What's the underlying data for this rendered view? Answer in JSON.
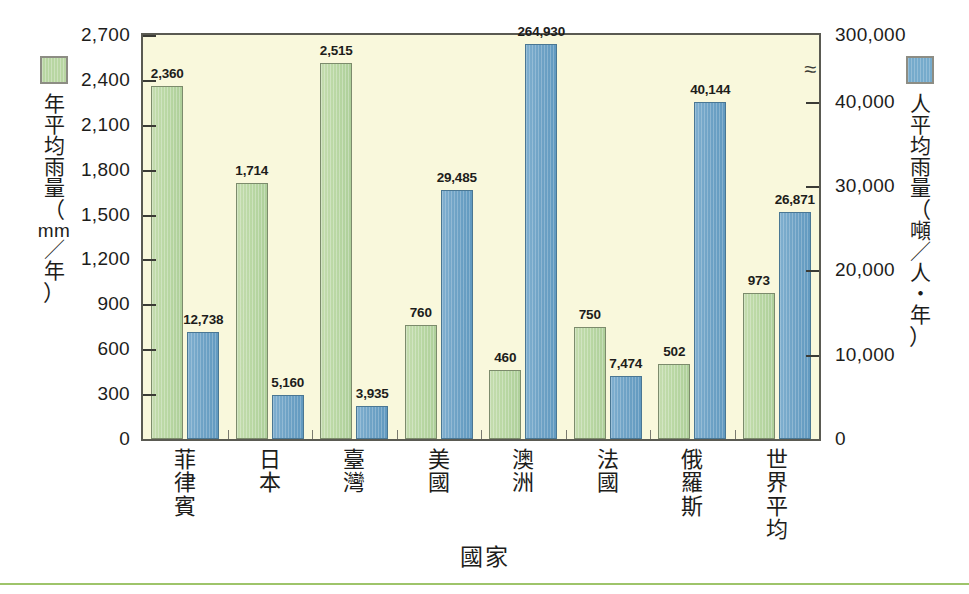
{
  "chart_data": {
    "type": "bar",
    "title": "",
    "xlabel": "國家",
    "categories": [
      "菲律賓",
      "日本",
      "臺灣",
      "美國",
      "澳洲",
      "法國",
      "俄羅斯",
      "世界平均"
    ],
    "series": [
      {
        "name": "年平均雨量（mm／年）",
        "axis": "left",
        "unit": "mm/年",
        "color": "#b8d6a2",
        "values": [
          2360,
          1714,
          2515,
          760,
          460,
          750,
          502,
          973
        ],
        "labels": [
          "2,360",
          "1,714",
          "2,515",
          "760",
          "460",
          "750",
          "502",
          "973"
        ]
      },
      {
        "name": "人平均雨量（噸／人・年）",
        "axis": "right",
        "unit": "噸/人·年",
        "color": "#76abcc",
        "values": [
          12738,
          5160,
          3935,
          29485,
          264930,
          7474,
          40144,
          26871
        ],
        "labels": [
          "12,738",
          "5,160",
          "3,935",
          "29,485",
          "264,930",
          "7,474",
          "40,144",
          "26,871"
        ]
      }
    ],
    "left_axis": {
      "label": "年平均雨量（mm／年）",
      "ticks": [
        "0",
        "300",
        "600",
        "900",
        "1,200",
        "1,500",
        "1,800",
        "2,100",
        "2,400",
        "2,700"
      ],
      "tick_values": [
        0,
        300,
        600,
        900,
        1200,
        1500,
        1800,
        2100,
        2400,
        2700
      ],
      "ylim": [
        0,
        2700
      ],
      "broken": false
    },
    "right_axis": {
      "label": "人平均雨量（噸／人・年）",
      "ticks": [
        "0",
        "10,000",
        "20,000",
        "30,000",
        "40,000",
        "300,000"
      ],
      "tick_values": [
        0,
        10000,
        20000,
        30000,
        40000,
        300000
      ],
      "ylim": [
        0,
        300000
      ],
      "broken": true,
      "break_symbol": "≈",
      "break_between": [
        40000,
        300000
      ]
    },
    "grid": false,
    "legend_position": "outside-left-and-right",
    "plot_background": "#f9f8dc"
  },
  "legend_left": {
    "name": "年平均雨量（mm／年）",
    "swatch_color": "#b8d6a2",
    "lines": [
      "年",
      "平",
      "均",
      "雨",
      "量",
      "（",
      "mm",
      "／",
      "年",
      "）"
    ]
  },
  "legend_right": {
    "name": "人平均雨量（噸／人・年）",
    "swatch_color": "#76abcc",
    "lines": [
      "人",
      "平",
      "均",
      "雨",
      "量",
      "（",
      "噸",
      "／",
      "人",
      "・",
      "年",
      "）"
    ]
  },
  "axis_titles": {
    "x": "國家"
  },
  "left_ticks": [
    "2,700",
    "2,400",
    "2,100",
    "1,800",
    "1,500",
    "1,200",
    "900",
    "600",
    "300",
    "0"
  ],
  "right_ticks": [
    "300,000",
    "40,000",
    "30,000",
    "20,000",
    "10,000",
    "0"
  ],
  "break_symbol": "≈"
}
